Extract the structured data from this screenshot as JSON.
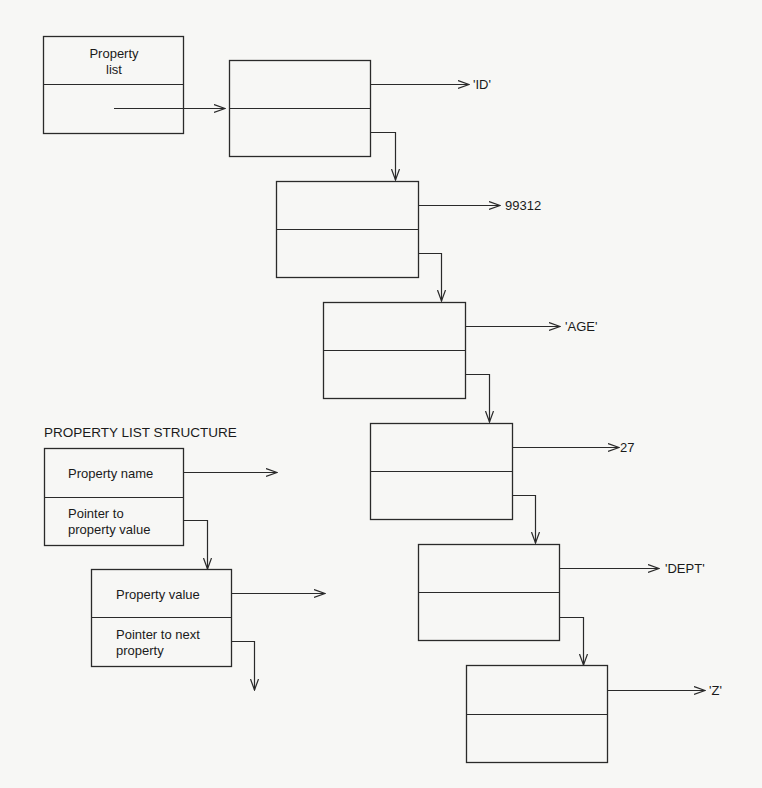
{
  "header_box": {
    "label_line1": "Property",
    "label_line2": "list"
  },
  "nodes": [
    {
      "value": "'ID'"
    },
    {
      "value": "99312"
    },
    {
      "value": "'AGE'"
    },
    {
      "value": "27"
    },
    {
      "value": "'DEPT'"
    },
    {
      "value": "'Z'"
    }
  ],
  "legend": {
    "title": "PROPERTY LIST STRUCTURE",
    "name_cell": {
      "top": "Property name",
      "bottom_line1": "Pointer to",
      "bottom_line2": "property value"
    },
    "value_cell": {
      "top": "Property value",
      "bottom_line1": "Pointer to next",
      "bottom_line2": "property"
    }
  },
  "colors": {
    "background": "#f7f7f5",
    "stroke": "#2a2a2a",
    "text": "#1a1a1a"
  }
}
